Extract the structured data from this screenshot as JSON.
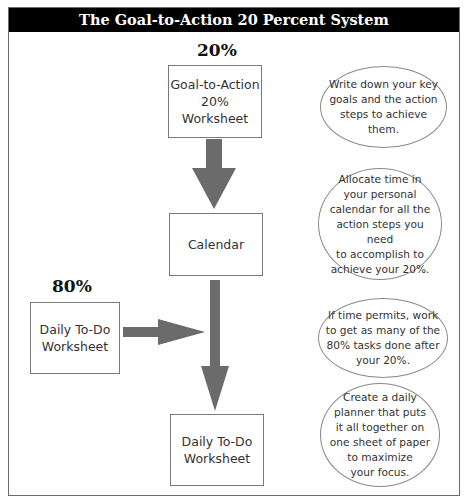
{
  "title": "The Goal-to-Action 20 Percent System",
  "labels": {
    "twenty_percent": "20%",
    "eighty_percent": "80%"
  },
  "boxes": [
    {
      "id": "goal-to-action-worksheet",
      "text": "Goal-to-Action\n20%\nWorksheet"
    },
    {
      "id": "calendar",
      "text": "Calendar"
    },
    {
      "id": "daily-todo-input",
      "text": "Daily To-Do\nWorksheet"
    },
    {
      "id": "daily-todo-output",
      "text": "Daily To-Do\nWorksheet"
    }
  ],
  "notes": [
    {
      "text": "Write down your key\ngoals and the action\nsteps to achieve them."
    },
    {
      "text": "Allocate time in\nyour personal\ncalendar for all the\naction steps you need\nto accomplish to\nachieve your 20%."
    },
    {
      "text": "If time permits, work\nto get as many of the\n80% tasks done after\nyour 20%."
    },
    {
      "text": "Create a daily\nplanner that puts\nit all together on\none sheet of paper\nto maximize\nyour focus."
    }
  ],
  "colors": {
    "header_bg": "#000000",
    "header_text": "#ffffff",
    "arrow": "#6b6b6b",
    "border": "#7a7a7a"
  }
}
